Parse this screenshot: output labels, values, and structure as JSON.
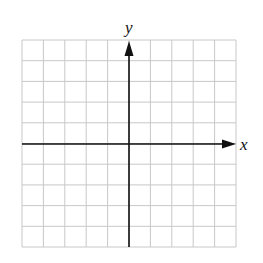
{
  "diagram": {
    "type": "coordinate-plane",
    "grid": {
      "columns": 10,
      "rows": 10,
      "line_color": "#c8c8c8"
    },
    "axes": {
      "x_label": "x",
      "y_label": "y",
      "color": "#111111"
    }
  }
}
